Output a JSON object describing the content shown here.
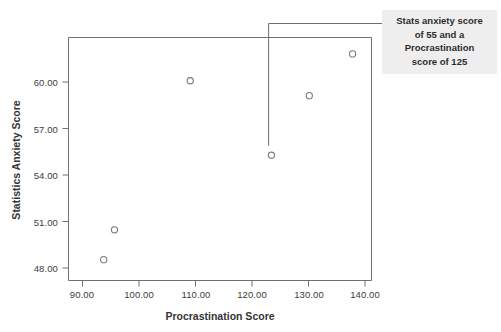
{
  "chart_data": {
    "type": "scatter",
    "title": "",
    "xlabel": "Procrastination Score",
    "ylabel": "Statistics Anxiety Score",
    "xlim": [
      87.5,
      143.5
    ],
    "ylim": [
      46.6,
      62.9
    ],
    "grid": false,
    "legend": null,
    "x_ticks": [
      "90.00",
      "100.00",
      "110.00",
      "120.00",
      "130.00",
      "140.00"
    ],
    "x_tick_values": [
      90,
      100,
      110,
      120,
      130,
      140
    ],
    "y_ticks": [
      "48.00",
      "51.00",
      "54.00",
      "57.00",
      "60.00"
    ],
    "y_tick_values": [
      48,
      51,
      54,
      57,
      60
    ],
    "points": [
      {
        "x": 94,
        "y": 48.0
      },
      {
        "x": 96,
        "y": 50.0
      },
      {
        "x": 110,
        "y": 60.0
      },
      {
        "x": 125,
        "y": 55.0
      },
      {
        "x": 132,
        "y": 59.0
      },
      {
        "x": 140,
        "y": 61.8
      }
    ],
    "marker": {
      "shape": "open-circle",
      "radius": 3.1,
      "stroke": "#7a7a7a",
      "fill": "none"
    },
    "annotations": [
      {
        "text": "Stats anxiety score of 55 and a Procrastination score of 125",
        "target_x": 125,
        "target_y": 55,
        "background": "#eeeeee"
      }
    ],
    "colors": {
      "frame": "#6f6f6f",
      "text": "#3a3a3a",
      "leader_line": "#6f6f6f",
      "background": "#ffffff"
    }
  },
  "annotation": {
    "line1": "Stats anxiety score",
    "line2": "of 55 and a",
    "line3": "Procrastination",
    "line4": "score of 125"
  }
}
